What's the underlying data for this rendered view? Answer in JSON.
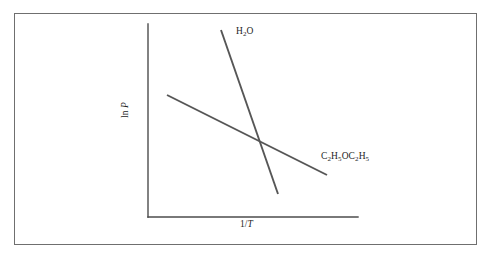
{
  "figure": {
    "frame_color": "#6f6f6f",
    "background": "#ffffff",
    "axis_color": "#4d4d4d",
    "line_color": "#565656"
  },
  "axes": {
    "x_label_prefix": "1/",
    "x_label_italic": "T",
    "y_label_prefix": "ln ",
    "y_label_italic": "P"
  },
  "curves": {
    "water": {
      "label_prefix": "H",
      "label_sub": "2",
      "label_suffix": "O"
    },
    "ether": {
      "label_part1": "C",
      "label_sub1": "2",
      "label_part2": "H",
      "label_sub2": "5",
      "label_part3": "OC",
      "label_sub3": "2",
      "label_part4": "H",
      "label_sub4": "5"
    }
  },
  "chart_data": {
    "type": "line",
    "title": "",
    "xlabel": "1/T",
    "ylabel": "ln P",
    "grid": false,
    "legend": "inline-annotations",
    "xlim": [
      0,
      1
    ],
    "ylim": [
      0,
      1
    ],
    "axis_ticks": {
      "x": [],
      "y": []
    },
    "axis_pixel_geometry": {
      "origin": [
        148,
        217
      ],
      "x_axis_end": [
        358,
        217
      ],
      "y_axis_top": [
        148,
        24
      ]
    },
    "series": [
      {
        "name": "H2O",
        "label": "H₂O",
        "description": "steep negative slope line (water)",
        "x": [
          0.348,
          0.619
        ],
        "y": [
          0.97,
          0.119
        ],
        "pixel_points": [
          [
            221,
            30
          ],
          [
            278,
            194
          ]
        ],
        "slope_sign": "negative",
        "relative_steepness": "steep"
      },
      {
        "name": "C2H5OC2H5",
        "label": "C₂H₅OC₂H₅",
        "description": "shallow negative slope line (diethyl ether)",
        "x": [
          0.09,
          0.852
        ],
        "y": [
          0.633,
          0.218
        ],
        "pixel_points": [
          [
            167,
            95
          ],
          [
            327,
            175
          ]
        ],
        "slope_sign": "negative",
        "relative_steepness": "shallow"
      }
    ],
    "intersection": {
      "pixel_point": [
        262,
        143
      ],
      "x": 0.543,
      "y": 0.384
    },
    "annotations": [
      {
        "text": "H₂O",
        "pixel_position": [
          236,
          26
        ],
        "anchor": "left"
      },
      {
        "text": "C₂H₅OC₂H₅",
        "pixel_position": [
          321,
          151
        ],
        "anchor": "left"
      },
      {
        "text": "1/T",
        "pixel_position": [
          240,
          219
        ],
        "anchor": "left"
      },
      {
        "text": "ln P",
        "pixel_position": [
          120,
          118
        ],
        "anchor": "rotated-left"
      }
    ]
  }
}
